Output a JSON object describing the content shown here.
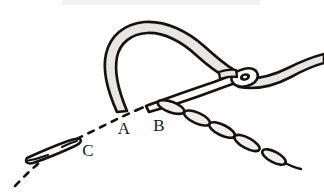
{
  "figure": {
    "background_color": "#ffffff",
    "ink_color": "#17120f",
    "thread_fill_color": "#e8e6e3",
    "needle_fill_color": "#ffffff",
    "stitch_fill_color": "#efeeec",
    "top_edge_band_color": "#f2f2f2"
  },
  "labels": [
    {
      "id": "point-a",
      "text": "A",
      "x": 124,
      "y": 134,
      "note": "entry point of thread loop on guideline"
    },
    {
      "id": "point-b",
      "text": "B",
      "x": 159,
      "y": 131,
      "note": "needle exit point starting the chain"
    },
    {
      "id": "point-c",
      "text": "C",
      "x": 88,
      "y": 156,
      "note": "second needle position along guideline"
    }
  ],
  "elements": [
    {
      "id": "guideline",
      "name": "dashed-guideline",
      "style": "dashed",
      "description": "dashed curve running from lower left through C, A and B"
    },
    {
      "id": "thread-loop",
      "name": "thread-loop",
      "description": "large arched loop of thread rising above the guideline between A and the needle eye"
    },
    {
      "id": "needle-main",
      "name": "sewing-needle",
      "description": "needle angled from lower-left point near B up to the eye at right"
    },
    {
      "id": "needle-eye",
      "name": "needle-eye",
      "description": "oval eye of the needle with thread passing through"
    },
    {
      "id": "thread-tail",
      "name": "thread-tail",
      "description": "thread trailing from the needle eye off the right edge"
    },
    {
      "id": "chain-stitches",
      "name": "chain-stitch-run",
      "count": 5,
      "description": "row of elongated oval chain stitches running down-right from B"
    },
    {
      "id": "needle-secondary",
      "name": "secondary-needle",
      "description": "small needle lying along the guideline at point C"
    }
  ]
}
